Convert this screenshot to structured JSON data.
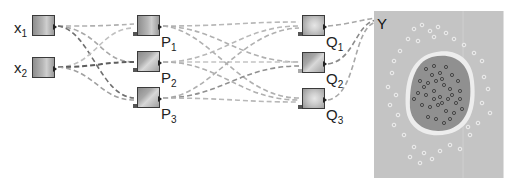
{
  "diagram": {
    "type": "neural-network-with-output-map",
    "input_nodes": [
      {
        "id": "x1",
        "label": "x",
        "sub": "1"
      },
      {
        "id": "x2",
        "label": "x",
        "sub": "2"
      }
    ],
    "hidden_layer_1": [
      {
        "id": "p1",
        "label": "P",
        "sub": "1"
      },
      {
        "id": "p2",
        "label": "P",
        "sub": "2"
      },
      {
        "id": "p3",
        "label": "P",
        "sub": "3"
      }
    ],
    "hidden_layer_2": [
      {
        "id": "q1",
        "label": "Q",
        "sub": "1"
      },
      {
        "id": "q2",
        "label": "Q",
        "sub": "2"
      },
      {
        "id": "q3",
        "label": "Q",
        "sub": "3"
      }
    ],
    "output": {
      "id": "y",
      "label": "Y",
      "description": "decision surface with scattered data points; dark blob of points inside, light points outside"
    },
    "edges": [
      [
        "x1",
        "p1"
      ],
      [
        "x1",
        "p2"
      ],
      [
        "x1",
        "p3"
      ],
      [
        "x2",
        "p1"
      ],
      [
        "x2",
        "p2"
      ],
      [
        "x2",
        "p3"
      ],
      [
        "p1",
        "q1"
      ],
      [
        "p1",
        "q2"
      ],
      [
        "p1",
        "q3"
      ],
      [
        "p2",
        "q1"
      ],
      [
        "p2",
        "q2"
      ],
      [
        "p2",
        "q3"
      ],
      [
        "p3",
        "q1"
      ],
      [
        "p3",
        "q2"
      ],
      [
        "p3",
        "q3"
      ],
      [
        "q1",
        "y"
      ],
      [
        "q2",
        "y"
      ],
      [
        "q3",
        "y"
      ]
    ],
    "colors": {
      "edge": "#b4b4b4",
      "edge_dark": "#6a6a6a",
      "panel_bg": "#c4c4c4",
      "blob": "#8f8f8f",
      "blob_halo": "#ececec"
    }
  }
}
